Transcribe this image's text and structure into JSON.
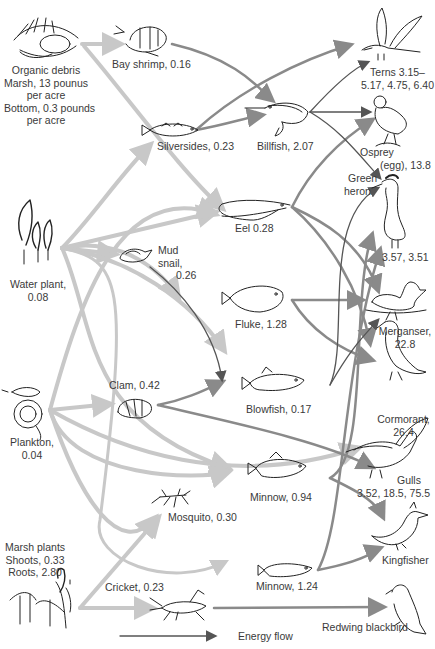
{
  "diagram": {
    "type": "food web",
    "legend": {
      "label": "Energy flow"
    },
    "nodes": {
      "organic_debris": {
        "lines": [
          "Organic debris",
          "Marsh, 13 pounus",
          "per acre",
          "Bottom, 0.3 pounds",
          "per acre"
        ],
        "icon": "debris-icon"
      },
      "bay_shrimp": {
        "label": "Bay shrimp, 0.16",
        "icon": "shrimp-icon"
      },
      "silversides": {
        "label": "Silversides, 0.23",
        "icon": "fish-icon"
      },
      "billfish": {
        "label": "Billfish, 2.07",
        "icon": "billfish-icon"
      },
      "terns": {
        "lines": [
          "Terns 3.15–",
          "5.17, 4.75, 6.40"
        ],
        "icon": "tern-icon"
      },
      "osprey": {
        "lines": [
          "Osprey",
          "(egg), 13.8"
        ],
        "icon": "osprey-icon"
      },
      "green_heron": {
        "lines": [
          "Green",
          "heron"
        ],
        "value": "3.57, 3.51",
        "icon": "heron-icon"
      },
      "water_plant": {
        "lines": [
          "Water plant,",
          "0.08"
        ],
        "icon": "water-plant-icon"
      },
      "eel": {
        "label": "Eel 0.28",
        "icon": "eel-icon"
      },
      "mud_snail": {
        "lines": [
          "Mud",
          "snail,",
          "0.26"
        ],
        "icon": "snail-icon"
      },
      "fluke": {
        "label": "Fluke, 1.28",
        "icon": "flatfish-icon"
      },
      "merganser": {
        "lines": [
          "Merganser,",
          "22.8"
        ],
        "icon": "duck-icon"
      },
      "plankton": {
        "lines": [
          "Plankton,",
          "0.04"
        ],
        "icon": "plankton-icon"
      },
      "clam": {
        "label": "Clam, 0.42",
        "icon": "clam-icon"
      },
      "blowfish": {
        "label": "Blowfish, 0.17",
        "icon": "blowfish-icon"
      },
      "cormorant": {
        "lines": [
          "Cormorant,",
          "26.4"
        ],
        "icon": "cormorant-icon"
      },
      "gulls": {
        "lines": [
          "Gulls",
          "3.52, 18.5, 75.5"
        ],
        "icon": "gull-icon"
      },
      "minnow_1": {
        "label": "Minnow, 0.94",
        "icon": "minnow-icon"
      },
      "mosquito": {
        "label": "Mosquito, 0.30",
        "icon": "mosquito-icon"
      },
      "kingfisher": {
        "label": "Kingfisher",
        "icon": "kingfisher-icon"
      },
      "marsh_plants": {
        "lines": [
          "Marsh plants",
          "Shoots, 0.33",
          "Roots, 2.80"
        ],
        "icon": "marsh-plant-icon"
      },
      "cricket": {
        "label": "Cricket, 0.23",
        "icon": "cricket-icon"
      },
      "minnow_2": {
        "label": "Minnow, 1.24",
        "icon": "minnow-icon"
      },
      "redwing_blackbird": {
        "label": "Redwing blackbird",
        "icon": "blackbird-icon"
      }
    },
    "colors": {
      "primary_flow": "#c8c8c8",
      "secondary_flow": "#8a8a8a",
      "tertiary_flow": "#555555",
      "drawing_ink": "#222222",
      "label_text": "#3a3a3a"
    }
  }
}
